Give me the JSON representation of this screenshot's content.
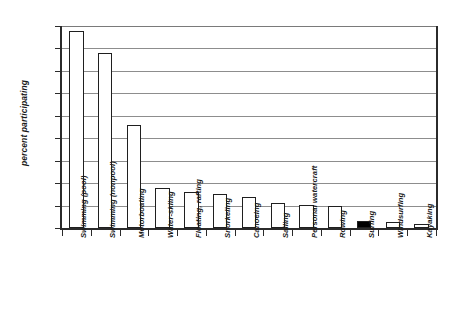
{
  "chart_data": {
    "type": "bar",
    "title": "",
    "xlabel": "",
    "ylabel": "percent participating",
    "ylim": [
      0,
      45
    ],
    "ytick_labels": [
      "0%",
      "5%",
      "10%",
      "15%",
      "20%",
      "25%",
      "30%",
      "35%",
      "40%",
      "45%"
    ],
    "ytick_values": [
      0,
      5,
      10,
      15,
      20,
      25,
      30,
      35,
      40,
      45
    ],
    "grid": true,
    "legend": "none",
    "categories": [
      "Swimming (pool)",
      "Swimming (nonpool)",
      "Motorboating",
      "Water-skiing",
      "Floating, rafting",
      "Snorkeling",
      "Canoeing",
      "Sailing",
      "Personal watercraft",
      "Rowing",
      "Surfing",
      "Windsurfing",
      "Kayaking"
    ],
    "values": [
      44,
      39,
      23,
      9,
      8,
      7.5,
      7,
      5.5,
      5.2,
      5,
      1.6,
      1.3,
      1
    ],
    "bar_colors": [
      "#ffffff",
      "#ffffff",
      "#ffffff",
      "#ffffff",
      "#ffffff",
      "#ffffff",
      "#ffffff",
      "#ffffff",
      "#ffffff",
      "#ffffff",
      "#000000",
      "#ffffff",
      "#ffffff"
    ],
    "highlighted_category": "Surfing",
    "highlight_color": "#000000",
    "bar_edge_color": "#1f1f1f",
    "axis_color": "#2b2b2b",
    "grid_color": "#8d8d8d",
    "background_color": "#ffffff"
  }
}
